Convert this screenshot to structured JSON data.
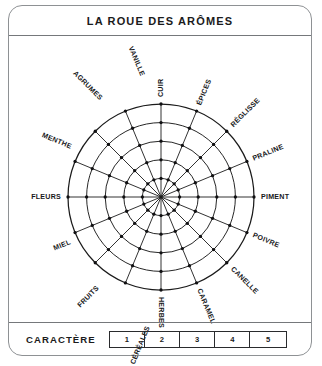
{
  "card": {
    "title": "LA ROUE DES ARÔMES",
    "border_color": "#8e9194"
  },
  "wheel": {
    "type": "radar-wheel",
    "spoke_count": 16,
    "ring_count": 5,
    "center_x": 152,
    "center_y": 161,
    "outer_radius": 93,
    "line_color": "#1b1b1b",
    "node_color": "#101012",
    "labels": [
      {
        "text": "CUIR",
        "angle": -90
      },
      {
        "text": "ÉPICES",
        "angle": -67.5
      },
      {
        "text": "RÉGLISSE",
        "angle": -45
      },
      {
        "text": "PRALINE",
        "angle": -22.5
      },
      {
        "text": "PIMENT",
        "angle": 0
      },
      {
        "text": "POIVRE",
        "angle": 22.5
      },
      {
        "text": "CANELLE",
        "angle": 45
      },
      {
        "text": "CARAMEL",
        "angle": 67.5
      },
      {
        "text": "HERBES",
        "angle": 90
      },
      {
        "text": "CÉRÉALES",
        "angle": 112.5
      },
      {
        "text": "FRUITS",
        "angle": 135
      },
      {
        "text": "MIEL",
        "angle": 157.5
      },
      {
        "text": "FLEURS",
        "angle": 180
      },
      {
        "text": "MENTHE",
        "angle": 202.5
      },
      {
        "text": "AGRUMES",
        "angle": 225
      },
      {
        "text": "VANILLE",
        "angle": 247.5
      }
    ]
  },
  "footer": {
    "label": "CARACTÈRE",
    "scale": [
      "1",
      "2",
      "3",
      "4",
      "5"
    ]
  }
}
